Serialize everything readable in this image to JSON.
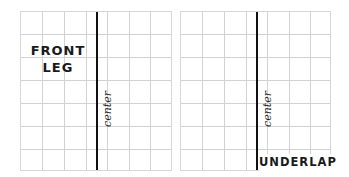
{
  "panels": [
    {
      "id": "front-leg",
      "label_lines": [
        "FRONT",
        "LEG"
      ],
      "center_label": "center"
    },
    {
      "id": "underlap",
      "label": "UNDERLAP",
      "center_label": "center"
    }
  ],
  "grid": {
    "columns": 7,
    "rows": 7,
    "line_color": "#d2d2d2",
    "center_line_color": "#111111"
  }
}
